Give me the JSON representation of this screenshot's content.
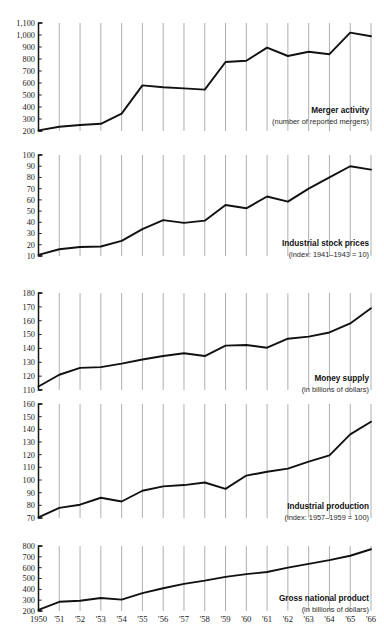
{
  "figure": {
    "background_color": "#ffffff",
    "line_color": "#111111",
    "gridline_color": "#8c8c8c",
    "axis_color": "#111111"
  },
  "x_axis": {
    "tick_labels": [
      "1950",
      "'51",
      "'52",
      "'53",
      "'54",
      "'55",
      "'56",
      "'57",
      "'58",
      "'59",
      "'60",
      "'61",
      "'62",
      "'63",
      "'64",
      "'65",
      "'66"
    ],
    "years": [
      1950,
      1951,
      1952,
      1953,
      1954,
      1955,
      1956,
      1957,
      1958,
      1959,
      1960,
      1961,
      1962,
      1963,
      1964,
      1965,
      1966
    ],
    "grid": true
  },
  "chart_data": [
    {
      "type": "line",
      "title": "Merger activity",
      "subtitle": "(number of reported mergers)",
      "xlabel": "",
      "ylabel": "",
      "ylim": [
        200,
        1100
      ],
      "ytick_labels": [
        "1,100",
        "1,000",
        "900",
        "800",
        "700",
        "600",
        "500",
        "400",
        "300",
        "200"
      ],
      "yticks": [
        1100,
        1000,
        900,
        800,
        700,
        600,
        500,
        400,
        300,
        200
      ],
      "x": [
        1950,
        1951,
        1952,
        1953,
        1954,
        1955,
        1956,
        1957,
        1958,
        1959,
        1960,
        1961,
        1962,
        1963,
        1964,
        1965,
        1966
      ],
      "values": [
        205,
        235,
        250,
        260,
        345,
        580,
        565,
        555,
        545,
        775,
        785,
        895,
        825,
        860,
        840,
        1020,
        990
      ]
    },
    {
      "type": "line",
      "title": "Industrial stock prices",
      "subtitle": "(index: 1941–1943 = 10)",
      "xlabel": "",
      "ylabel": "",
      "ylim": [
        10,
        100
      ],
      "ytick_labels": [
        "100",
        "90",
        "80",
        "70",
        "60",
        "50",
        "40",
        "30",
        "20",
        "10"
      ],
      "yticks": [
        100,
        90,
        80,
        70,
        60,
        50,
        40,
        30,
        20,
        10
      ],
      "x": [
        1950,
        1951,
        1952,
        1953,
        1954,
        1955,
        1956,
        1957,
        1958,
        1959,
        1960,
        1961,
        1962,
        1963,
        1964,
        1965,
        1966
      ],
      "values": [
        11,
        16,
        18,
        18.5,
        23.5,
        34,
        42,
        39.5,
        41.5,
        55.5,
        52.5,
        63,
        58.5,
        70,
        80,
        90,
        87
      ]
    },
    {
      "type": "line",
      "title": "Money supply",
      "subtitle": "(in billions of dollars)",
      "xlabel": "",
      "ylabel": "",
      "ylim": [
        110,
        180
      ],
      "ytick_labels": [
        "180",
        "170",
        "160",
        "150",
        "140",
        "130",
        "120",
        "110"
      ],
      "yticks": [
        180,
        170,
        160,
        150,
        140,
        130,
        120,
        110
      ],
      "x": [
        1950,
        1951,
        1952,
        1953,
        1954,
        1955,
        1956,
        1957,
        1958,
        1959,
        1960,
        1961,
        1962,
        1963,
        1964,
        1965,
        1966
      ],
      "values": [
        112.5,
        121,
        126,
        126.5,
        129,
        132,
        134.5,
        136.5,
        134.5,
        142,
        142.5,
        140.5,
        147,
        148.5,
        151.5,
        158,
        169
      ]
    },
    {
      "type": "line",
      "title": "Industrial production",
      "subtitle": "(index: 1957–1959 = 100)",
      "xlabel": "",
      "ylabel": "",
      "ylim": [
        70,
        160
      ],
      "ytick_labels": [
        "160",
        "150",
        "140",
        "130",
        "120",
        "110",
        "100",
        "90",
        "80",
        "70"
      ],
      "yticks": [
        160,
        150,
        140,
        130,
        120,
        110,
        100,
        90,
        80,
        70
      ],
      "x": [
        1950,
        1951,
        1952,
        1953,
        1954,
        1955,
        1956,
        1957,
        1958,
        1959,
        1960,
        1961,
        1962,
        1963,
        1964,
        1965,
        1966
      ],
      "values": [
        70.5,
        78,
        80.5,
        86,
        83,
        91.5,
        95,
        96,
        98,
        93,
        103.5,
        106.5,
        109,
        114.5,
        119.5,
        136,
        146
      ]
    },
    {
      "type": "line",
      "title": "Gross national product",
      "subtitle": "(in billions of dollars)",
      "xlabel": "",
      "ylabel": "",
      "ylim": [
        200,
        800
      ],
      "ytick_labels": [
        "800",
        "700",
        "600",
        "500",
        "400",
        "300",
        "200"
      ],
      "yticks": [
        800,
        700,
        600,
        500,
        400,
        300,
        200
      ],
      "x": [
        1950,
        1951,
        1952,
        1953,
        1954,
        1955,
        1956,
        1957,
        1958,
        1959,
        1960,
        1961,
        1962,
        1963,
        1964,
        1965,
        1966
      ],
      "values": [
        210,
        285,
        295,
        320,
        305,
        365,
        410,
        450,
        480,
        515,
        540,
        560,
        600,
        635,
        670,
        710,
        770
      ]
    }
  ]
}
